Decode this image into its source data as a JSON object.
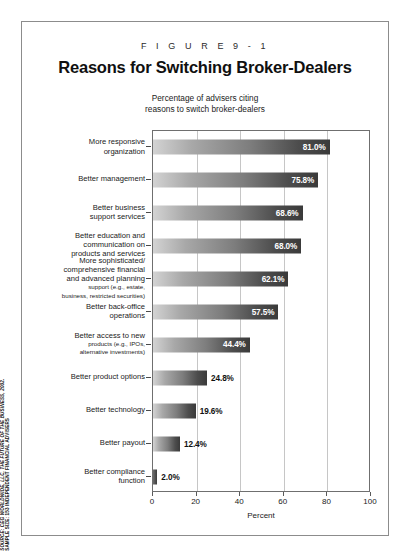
{
  "figure": {
    "number": "F I G U R E   9 - 1",
    "title": "Reasons for Switching Broker-Dealers",
    "subtitle_line1": "Percentage of advisers citing",
    "subtitle_line2": "reasons to switch broker-dealers"
  },
  "source": {
    "line1": "SOURCE: CEG WORLDWIDE, LLC, THE FUTURE OF THE BUSINESS, 2002.",
    "line2": "SAMPLE SIZE: 153 INDEPENDENT FINANCIAL ADVISERS"
  },
  "chart_data": {
    "type": "bar",
    "orientation": "horizontal",
    "title": "Reasons for Switching Broker-Dealers",
    "subtitle": "Percentage of advisers citing reasons to switch broker-dealers",
    "xlabel": "Percent",
    "ylabel": "",
    "xlim": [
      0,
      100
    ],
    "xticks": [
      0,
      20,
      40,
      60,
      80,
      100
    ],
    "grid": true,
    "legend": "none",
    "categories": [
      "More responsive organization",
      "Better management",
      "Better business support services",
      "Better education and communication on products and services",
      "More sophisticated/comprehensive financial and advanced planning support (e.g., estate, business, restricted securities)",
      "Better back-office operations",
      "Better access to new products (e.g., IPOs, alternative investments)",
      "Better product options",
      "Better technology",
      "Better payout",
      "Better compliance function"
    ],
    "values": [
      81.0,
      75.8,
      68.6,
      68.0,
      62.1,
      57.5,
      44.4,
      24.8,
      19.6,
      12.4,
      2.0
    ],
    "value_labels": [
      "81.0%",
      "75.8%",
      "68.6%",
      "68.0%",
      "62.1%",
      "57.5%",
      "44.4%",
      "24.8%",
      "19.6%",
      "12.4%",
      "2.0%"
    ]
  },
  "bars": [
    {
      "label_lines": [
        "More responsive",
        "organization"
      ],
      "sub_lines": [],
      "value": 81.0,
      "value_label": "81.0%",
      "label_inside": true
    },
    {
      "label_lines": [
        "Better management"
      ],
      "sub_lines": [],
      "value": 75.8,
      "value_label": "75.8%",
      "label_inside": true
    },
    {
      "label_lines": [
        "Better business",
        "support services"
      ],
      "sub_lines": [],
      "value": 68.6,
      "value_label": "68.6%",
      "label_inside": true
    },
    {
      "label_lines": [
        "Better education and",
        "communication on",
        "products and services"
      ],
      "sub_lines": [],
      "value": 68.0,
      "value_label": "68.0%",
      "label_inside": true
    },
    {
      "label_lines": [
        "More sophisticated/",
        "comprehensive financial",
        "and advanced planning"
      ],
      "sub_lines": [
        "support (e.g., estate,",
        "business, restricted securities)"
      ],
      "value": 62.1,
      "value_label": "62.1%",
      "label_inside": true
    },
    {
      "label_lines": [
        "Better back-office",
        "operations"
      ],
      "sub_lines": [],
      "value": 57.5,
      "value_label": "57.5%",
      "label_inside": true
    },
    {
      "label_lines": [
        "Better access to new"
      ],
      "sub_lines": [
        "products (e.g., IPOs,",
        "alternative investments)"
      ],
      "value": 44.4,
      "value_label": "44.4%",
      "label_inside": true
    },
    {
      "label_lines": [
        "Better product options"
      ],
      "sub_lines": [],
      "value": 24.8,
      "value_label": "24.8%",
      "label_inside": false
    },
    {
      "label_lines": [
        "Better technology"
      ],
      "sub_lines": [],
      "value": 19.6,
      "value_label": "19.6%",
      "label_inside": false
    },
    {
      "label_lines": [
        "Better payout"
      ],
      "sub_lines": [],
      "value": 12.4,
      "value_label": "12.4%",
      "label_inside": false
    },
    {
      "label_lines": [
        "Better compliance",
        "function"
      ],
      "sub_lines": [],
      "value": 2.0,
      "value_label": "2.0%",
      "label_inside": false
    }
  ],
  "axis": {
    "ticks": [
      "0",
      "20",
      "40",
      "60",
      "80",
      "100"
    ],
    "title": "Percent"
  },
  "colors": {
    "bar_light": "#d3d3d3",
    "bar_dark": "#3a3a3a",
    "frame": "#8c8c8c",
    "grid": "#c6c6c6",
    "text": "#1a1a1a"
  }
}
